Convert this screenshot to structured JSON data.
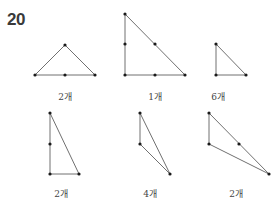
{
  "problem_number": "20",
  "figures": [
    {
      "label": "2개",
      "label_pos": [
        65,
        90
      ],
      "lines": [
        [
          35,
          75,
          65,
          45
        ],
        [
          65,
          45,
          95,
          75
        ],
        [
          35,
          75,
          95,
          75
        ]
      ],
      "points": [
        [
          35,
          75
        ],
        [
          65,
          45
        ],
        [
          95,
          75
        ],
        [
          65,
          75
        ]
      ]
    },
    {
      "label": "1개",
      "label_pos": [
        155,
        90
      ],
      "lines": [
        [
          125,
          14,
          125,
          75
        ],
        [
          125,
          75,
          185,
          75
        ],
        [
          125,
          14,
          185,
          75
        ]
      ],
      "points": [
        [
          125,
          14
        ],
        [
          125,
          44
        ],
        [
          125,
          75
        ],
        [
          155,
          44
        ],
        [
          155,
          75
        ],
        [
          185,
          75
        ]
      ]
    },
    {
      "label": "6개",
      "label_pos": [
        218,
        90
      ],
      "lines": [
        [
          216,
          44,
          216,
          75
        ],
        [
          216,
          75,
          246,
          75
        ],
        [
          216,
          44,
          246,
          75
        ]
      ],
      "points": [
        [
          216,
          44
        ],
        [
          216,
          75
        ],
        [
          246,
          75
        ]
      ]
    },
    {
      "label": "2개",
      "label_pos": [
        61,
        187
      ],
      "lines": [
        [
          50,
          113,
          50,
          174
        ],
        [
          50,
          174,
          79,
          174
        ],
        [
          50,
          113,
          79,
          174
        ]
      ],
      "points": [
        [
          50,
          113
        ],
        [
          50,
          144
        ],
        [
          50,
          174
        ],
        [
          79,
          174
        ]
      ]
    },
    {
      "label": "4개",
      "label_pos": [
        150,
        187
      ],
      "lines": [
        [
          140,
          113,
          140,
          144
        ],
        [
          140,
          144,
          170,
          174
        ],
        [
          140,
          113,
          170,
          174
        ]
      ],
      "points": [
        [
          140,
          113
        ],
        [
          140,
          144
        ],
        [
          170,
          174
        ]
      ]
    },
    {
      "label": "2개",
      "label_pos": [
        236,
        187
      ],
      "lines": [
        [
          209,
          113,
          209,
          144
        ],
        [
          209,
          144,
          269,
          174
        ],
        [
          209,
          113,
          269,
          174
        ]
      ],
      "points": [
        [
          209,
          113
        ],
        [
          209,
          144
        ],
        [
          239,
          144
        ],
        [
          269,
          174
        ]
      ]
    }
  ],
  "colors": {
    "line": "#707070",
    "point": "#1a1a1a",
    "text": "#444444"
  }
}
